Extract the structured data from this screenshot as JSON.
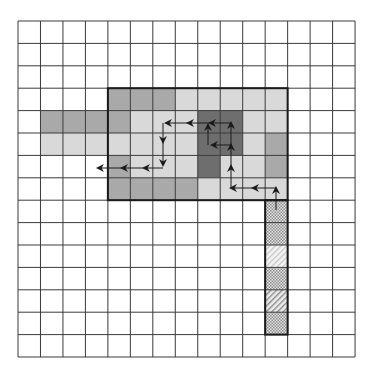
{
  "grid": {
    "rows": 15,
    "cols": 15,
    "origin_x": 18,
    "origin_y": 21,
    "cell_w": 22.47,
    "cell_h": 22.4,
    "line_color": "#3a3a3a"
  },
  "colors": {
    "dark": "#6e6e6e",
    "mid": "#a9a9a9",
    "light": "#d9d9d9",
    "border": "#1a1a1a",
    "arrow": "#1a1a1a"
  },
  "shaded_cells": [
    {
      "r": 3,
      "c": 4,
      "tone": "mid"
    },
    {
      "r": 3,
      "c": 5,
      "tone": "mid"
    },
    {
      "r": 3,
      "c": 6,
      "tone": "mid"
    },
    {
      "r": 3,
      "c": 7,
      "tone": "light"
    },
    {
      "r": 3,
      "c": 8,
      "tone": "light"
    },
    {
      "r": 3,
      "c": 9,
      "tone": "light"
    },
    {
      "r": 3,
      "c": 10,
      "tone": "light"
    },
    {
      "r": 3,
      "c": 11,
      "tone": "light"
    },
    {
      "r": 4,
      "c": 1,
      "tone": "mid"
    },
    {
      "r": 4,
      "c": 2,
      "tone": "mid"
    },
    {
      "r": 4,
      "c": 3,
      "tone": "mid"
    },
    {
      "r": 4,
      "c": 4,
      "tone": "mid"
    },
    {
      "r": 4,
      "c": 5,
      "tone": "light"
    },
    {
      "r": 4,
      "c": 6,
      "tone": "light"
    },
    {
      "r": 4,
      "c": 7,
      "tone": "light"
    },
    {
      "r": 4,
      "c": 8,
      "tone": "dark"
    },
    {
      "r": 4,
      "c": 9,
      "tone": "dark"
    },
    {
      "r": 4,
      "c": 10,
      "tone": "light"
    },
    {
      "r": 4,
      "c": 11,
      "tone": "light"
    },
    {
      "r": 5,
      "c": 1,
      "tone": "light"
    },
    {
      "r": 5,
      "c": 2,
      "tone": "light"
    },
    {
      "r": 5,
      "c": 3,
      "tone": "light"
    },
    {
      "r": 5,
      "c": 4,
      "tone": "light"
    },
    {
      "r": 5,
      "c": 5,
      "tone": "light"
    },
    {
      "r": 5,
      "c": 6,
      "tone": "light"
    },
    {
      "r": 5,
      "c": 7,
      "tone": "light"
    },
    {
      "r": 5,
      "c": 8,
      "tone": "dark"
    },
    {
      "r": 5,
      "c": 9,
      "tone": "dark"
    },
    {
      "r": 5,
      "c": 10,
      "tone": "light"
    },
    {
      "r": 5,
      "c": 11,
      "tone": "mid"
    },
    {
      "r": 6,
      "c": 4,
      "tone": "mid"
    },
    {
      "r": 6,
      "c": 5,
      "tone": "light"
    },
    {
      "r": 6,
      "c": 6,
      "tone": "light"
    },
    {
      "r": 6,
      "c": 7,
      "tone": "light"
    },
    {
      "r": 6,
      "c": 8,
      "tone": "dark"
    },
    {
      "r": 6,
      "c": 9,
      "tone": "light"
    },
    {
      "r": 6,
      "c": 10,
      "tone": "light"
    },
    {
      "r": 6,
      "c": 11,
      "tone": "mid"
    },
    {
      "r": 7,
      "c": 4,
      "tone": "mid"
    },
    {
      "r": 7,
      "c": 5,
      "tone": "mid"
    },
    {
      "r": 7,
      "c": 6,
      "tone": "mid"
    },
    {
      "r": 7,
      "c": 7,
      "tone": "mid"
    },
    {
      "r": 7,
      "c": 8,
      "tone": "light"
    },
    {
      "r": 7,
      "c": 9,
      "tone": "light"
    },
    {
      "r": 7,
      "c": 10,
      "tone": "light"
    },
    {
      "r": 7,
      "c": 11,
      "tone": "light"
    }
  ],
  "region_box": {
    "r0": 3,
    "c0": 4,
    "r1": 7,
    "c1": 11
  },
  "hatched_column": {
    "c": 11,
    "cells": [
      {
        "r": 8,
        "pattern": "crosshatch"
      },
      {
        "r": 9,
        "pattern": "crosshatch"
      },
      {
        "r": 10,
        "pattern": "diagonal-light"
      },
      {
        "r": 11,
        "pattern": "crosshatch"
      },
      {
        "r": 12,
        "pattern": "diagonal"
      },
      {
        "r": 13,
        "pattern": "crosshatch"
      }
    ]
  },
  "arrows": [
    {
      "from": [
        276,
        210
      ],
      "to": [
        276,
        188
      ]
    },
    {
      "from": [
        276,
        188
      ],
      "to": [
        253,
        188
      ]
    },
    {
      "from": [
        253,
        188
      ],
      "to": [
        231,
        188
      ]
    },
    {
      "from": [
        231,
        188
      ],
      "to": [
        231,
        166
      ]
    },
    {
      "from": [
        231,
        166
      ],
      "to": [
        231,
        145
      ]
    },
    {
      "from": [
        231,
        145
      ],
      "to": [
        231,
        123
      ]
    },
    {
      "from": [
        231,
        123
      ],
      "to": [
        210,
        123
      ]
    },
    {
      "from": [
        231,
        145
      ],
      "to": [
        212,
        145
      ]
    },
    {
      "from": [
        208,
        145
      ],
      "to": [
        208,
        125
      ]
    },
    {
      "from": [
        210,
        123
      ],
      "to": [
        188,
        123
      ]
    },
    {
      "from": [
        188,
        123
      ],
      "to": [
        166,
        123
      ]
    },
    {
      "from": [
        163,
        123
      ],
      "to": [
        163,
        142
      ]
    },
    {
      "from": [
        163,
        142
      ],
      "to": [
        163,
        165
      ]
    },
    {
      "from": [
        163,
        168
      ],
      "to": [
        144,
        168
      ]
    },
    {
      "from": [
        144,
        168
      ],
      "to": [
        122,
        168
      ]
    },
    {
      "from": [
        122,
        168
      ],
      "to": [
        98,
        168
      ]
    }
  ]
}
